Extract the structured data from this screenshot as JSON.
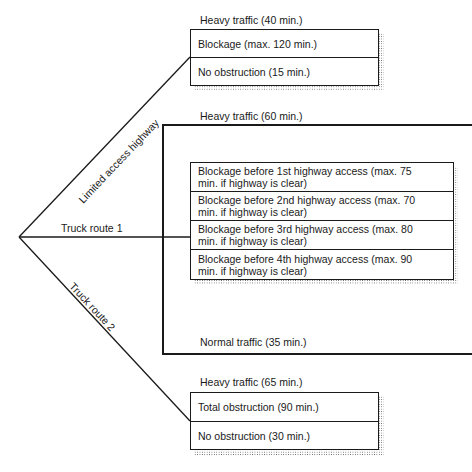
{
  "routes": [
    {
      "name": "Limited access highway"
    },
    {
      "name": "Truck route 1"
    },
    {
      "name": "Truck route 2"
    }
  ],
  "highway": {
    "condition_label": "Heavy traffic (40 min.)",
    "outcomes": [
      "Blockage (max. 120 min.)",
      "No obstruction (15 min.)"
    ]
  },
  "truck1": {
    "heavy_label": "Heavy traffic (60 min.)",
    "normal_label": "Normal traffic (35 min.)",
    "outcomes": [
      {
        "line1": "Blockage before 1st highway access (max. 75",
        "line2": "min. if highway is clear)"
      },
      {
        "line1": "Blockage before 2nd highway access (max. 70",
        "line2": "min. if highway is clear)"
      },
      {
        "line1": "Blockage before 3rd highway access (max. 80",
        "line2": "min. if highway is clear)"
      },
      {
        "line1": "Blockage before 4th highway access (max. 90",
        "line2": "min. if highway is clear)"
      }
    ]
  },
  "truck2": {
    "condition_label": "Heavy traffic (65 min.)",
    "outcomes": [
      "Total obstruction (90 min.)",
      "No obstruction (30 min.)"
    ]
  }
}
